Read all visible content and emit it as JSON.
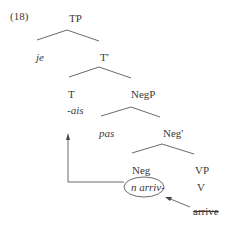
{
  "example_number": "(18)",
  "tree": {
    "nodes": {
      "tp": "TP",
      "je": "je",
      "t_bar": "T'",
      "t": "T",
      "ais": "-ais",
      "negp": "NegP",
      "pas": "pas",
      "neg_bar": "Neg'",
      "neg": "Neg",
      "n_arriv": "n arriv-",
      "vp": "VP",
      "v": "V",
      "arrive": "arrive"
    },
    "annotations": {
      "circled": "n arriv-",
      "struck_through": "arrive",
      "movement_arrow_target": "T",
      "movement_arrow_source": "n arriv-",
      "head_movement_source": "arrive",
      "head_movement_target": "n arriv-"
    }
  },
  "colors": {
    "text": "#3a3a3a",
    "lines": "#444444",
    "background": "#ffffff"
  }
}
